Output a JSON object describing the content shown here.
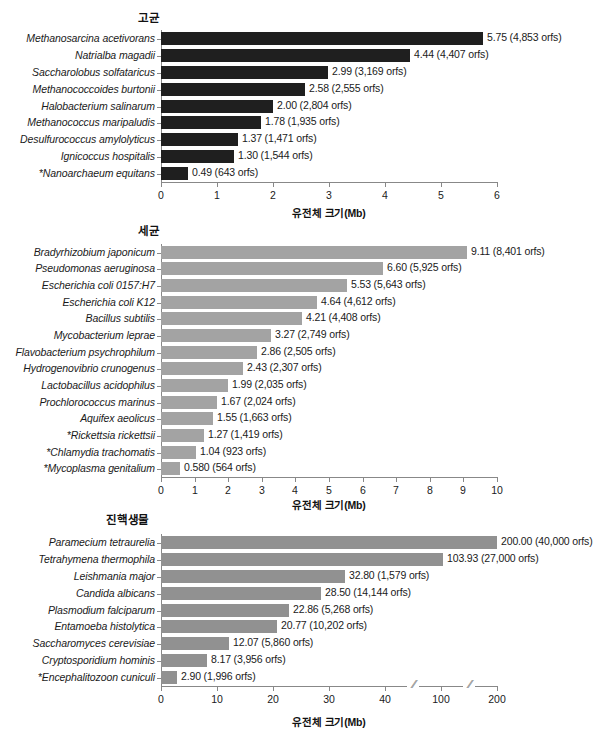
{
  "figure": {
    "axis_title": "유전체 크기(Mb)",
    "colors": {
      "archaea_bar": "#1f1f1f",
      "bacteria_bar": "#a3a3a3",
      "eukaryote_bar": "#919191",
      "axis": "#888888",
      "text": "#1a1a1a",
      "background": "#ffffff"
    }
  },
  "chart_data": [
    {
      "type": "bar",
      "orientation": "horizontal",
      "title": "고균",
      "xlabel": "유전체 크기(Mb)",
      "ylabel": "",
      "xlim": [
        0,
        6
      ],
      "xticks": [
        "0",
        "1",
        "2",
        "3",
        "4",
        "5",
        "6"
      ],
      "xtick_values": [
        0,
        1,
        2,
        3,
        4,
        5,
        6
      ],
      "grid": false,
      "legend": "none",
      "bar_color": "#1f1f1f",
      "categories": [
        "Methanosarcina acetivorans",
        "Natrialba magadii",
        "Saccharolobus solfataricus",
        "Methanococcoides burtonii",
        "Halobacterium salinarum",
        "Methanococcus maripaludis",
        "Desulfurococcus amylolyticus",
        "Ignicoccus hospitalis",
        "*Nanoarchaeum equitans"
      ],
      "values": [
        5.75,
        4.44,
        2.99,
        2.58,
        2.0,
        1.78,
        1.37,
        1.3,
        0.49
      ],
      "data_labels": [
        "5.75 (4,853 orfs)",
        "4.44 (4,407 orfs)",
        "2.99 (3,169 orfs)",
        "2.58 (2,555 orfs)",
        "2.00 (2,804 orfs)",
        "1.78 (1,935 orfs)",
        "1.37 (1,471 orfs)",
        "1.30 (1,544 orfs)",
        "0.49 (643 orfs)"
      ],
      "orfs": [
        4853,
        4407,
        3169,
        2555,
        2804,
        1935,
        1471,
        1544,
        643
      ]
    },
    {
      "type": "bar",
      "orientation": "horizontal",
      "title": "세균",
      "xlabel": "유전체 크기(Mb)",
      "ylabel": "",
      "xlim": [
        0,
        10
      ],
      "xticks": [
        "0",
        "1",
        "2",
        "3",
        "4",
        "5",
        "6",
        "7",
        "8",
        "9",
        "10"
      ],
      "xtick_values": [
        0,
        1,
        2,
        3,
        4,
        5,
        6,
        7,
        8,
        9,
        10
      ],
      "grid": false,
      "legend": "none",
      "bar_color": "#a3a3a3",
      "categories": [
        "Bradyrhizobium japonicum",
        "Pseudomonas aeruginosa",
        "Escherichia coli 0157:H7",
        "Escherichia coli K12",
        "Bacillus subtilis",
        "Mycobacterium leprae",
        "Flavobacterium psychrophilum",
        "Hydrogenovibrio crunogenus",
        "Lactobacillus acidophilus",
        "Prochlorococcus marinus",
        "Aquifex aeolicus",
        "*Rickettsia rickettsii",
        "*Chlamydia trachomatis",
        "*Mycoplasma genitalium"
      ],
      "values": [
        9.11,
        6.6,
        5.53,
        4.64,
        4.21,
        3.27,
        2.86,
        2.43,
        1.99,
        1.67,
        1.55,
        1.27,
        1.04,
        0.58
      ],
      "data_labels": [
        "9.11 (8,401 orfs)",
        "6.60 (5,925 orfs)",
        "5.53 (5,643 orfs)",
        "4.64 (4,612 orfs)",
        "4.21 (4,408 orfs)",
        "3.27 (2,749 orfs)",
        "2.86 (2,505 orfs)",
        "2.43 (2,307 orfs)",
        "1.99 (2,035 orfs)",
        "1.67 (2,024 orfs)",
        "1.55 (1,663 orfs)",
        "1.27 (1,419 orfs)",
        "1.04 (923 orfs)",
        "0.580 (564 orfs)"
      ],
      "orfs": [
        8401,
        5925,
        5643,
        4612,
        4408,
        2749,
        2505,
        2307,
        2035,
        2024,
        1663,
        1419,
        923,
        564
      ]
    },
    {
      "type": "bar",
      "orientation": "horizontal",
      "title": "진핵생물",
      "xlabel": "유전체 크기(Mb)",
      "ylabel": "",
      "xlim": [
        0,
        200
      ],
      "axis_break": true,
      "xticks": [
        "0",
        "10",
        "20",
        "30",
        "40",
        "100",
        "200"
      ],
      "xtick_values": [
        0,
        10,
        20,
        30,
        40,
        100,
        200
      ],
      "grid": false,
      "legend": "none",
      "bar_color": "#919191",
      "categories": [
        "Paramecium tetraurelia",
        "Tetrahymena thermophila",
        "Leishmania major",
        "Candida albicans",
        "Plasmodium falciparum",
        "Entamoeba histolytica",
        "Saccharomyces cerevisiae",
        "Cryptosporidium hominis",
        "*Encephalitozoon cuniculi"
      ],
      "values": [
        200.0,
        103.93,
        32.8,
        28.5,
        22.86,
        20.77,
        12.07,
        8.17,
        2.9
      ],
      "data_labels": [
        "200.00 (40,000 orfs)",
        "103.93 (27,000 orfs)",
        "32.80 (1,579 orfs)",
        "28.50 (14,144 orfs)",
        "22.86 (5,268 orfs)",
        "20.77 (10,202 orfs)",
        "12.07 (5,860 orfs)",
        "8.17 (3,956 orfs)",
        "2.90 (1,996 orfs)"
      ],
      "orfs": [
        40000,
        27000,
        1579,
        14144,
        5268,
        10202,
        5860,
        3956,
        1996
      ]
    }
  ]
}
